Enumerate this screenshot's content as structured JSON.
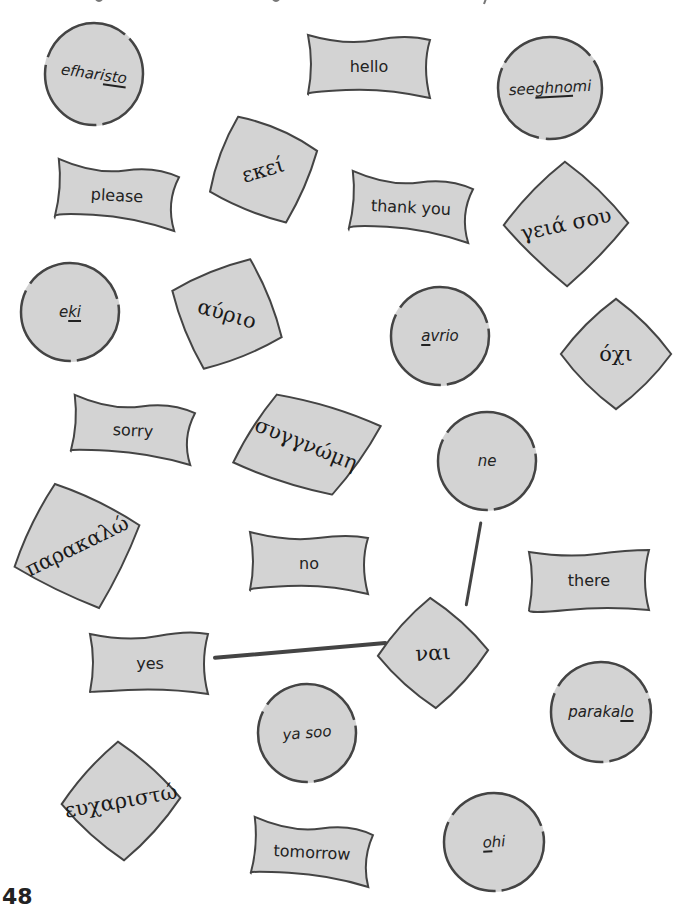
{
  "page": {
    "number": "48",
    "colors": {
      "card_fill": "#d3d3d3",
      "outline": "#444444",
      "text": "#222222",
      "background": "#ffffff"
    }
  },
  "cards": {
    "efharisto": {
      "kind": "transliteration",
      "shape": "circle",
      "pre": "efhari",
      "underlined": "sto",
      "post": ""
    },
    "hello": {
      "kind": "english",
      "shape": "wavy",
      "text": "hello"
    },
    "seeghnomi": {
      "kind": "transliteration",
      "shape": "circle",
      "pre": "see",
      "underlined": "ghno",
      "post": "mi"
    },
    "please": {
      "kind": "english",
      "shape": "wavy",
      "text": "please"
    },
    "ekei_greek": {
      "kind": "greek",
      "shape": "diamond",
      "text": "εκεί"
    },
    "thank_you": {
      "kind": "english",
      "shape": "wavy",
      "text": "thank you"
    },
    "geia_sou": {
      "kind": "greek",
      "shape": "diamond",
      "text": "γειά σου"
    },
    "eki": {
      "kind": "transliteration",
      "shape": "circle",
      "pre": "e",
      "underlined": "ki",
      "post": ""
    },
    "avrio_greek": {
      "kind": "greek",
      "shape": "diamond",
      "text": "αύριο"
    },
    "avrio": {
      "kind": "transliteration",
      "shape": "circle",
      "pre": "",
      "underlined": "a",
      "post": "vrio"
    },
    "ochi_greek": {
      "kind": "greek",
      "shape": "diamond",
      "text": "όχι"
    },
    "sorry": {
      "kind": "english",
      "shape": "wavy",
      "text": "sorry"
    },
    "syngnomi_greek": {
      "kind": "greek",
      "shape": "diamond",
      "text": "συγγνώμη"
    },
    "ne": {
      "kind": "transliteration",
      "shape": "circle",
      "pre": "ne",
      "underlined": "",
      "post": ""
    },
    "parakalo_greek": {
      "kind": "greek",
      "shape": "diamond",
      "text": "παρακαλώ"
    },
    "no": {
      "kind": "english",
      "shape": "wavy",
      "text": "no"
    },
    "there": {
      "kind": "english",
      "shape": "wavy",
      "text": "there"
    },
    "yes": {
      "kind": "english",
      "shape": "wavy",
      "text": "yes"
    },
    "nai_greek": {
      "kind": "greek",
      "shape": "diamond",
      "text": "ναι"
    },
    "ya_soo": {
      "kind": "transliteration",
      "shape": "circle",
      "pre": "ya soo",
      "underlined": "",
      "post": ""
    },
    "parakalo": {
      "kind": "transliteration",
      "shape": "circle",
      "pre": "paraka",
      "underlined": "lo",
      "post": ""
    },
    "efcharisto_greek": {
      "kind": "greek",
      "shape": "diamond",
      "text": "ευχαριστώ"
    },
    "tomorrow": {
      "kind": "english",
      "shape": "wavy",
      "text": "tomorrow"
    },
    "ohi": {
      "kind": "transliteration",
      "shape": "circle",
      "pre": "",
      "underlined": "o",
      "post": "hi"
    }
  },
  "connections": [
    {
      "from": "ne",
      "to": "nai_greek"
    },
    {
      "from": "yes",
      "to": "nai_greek"
    }
  ]
}
